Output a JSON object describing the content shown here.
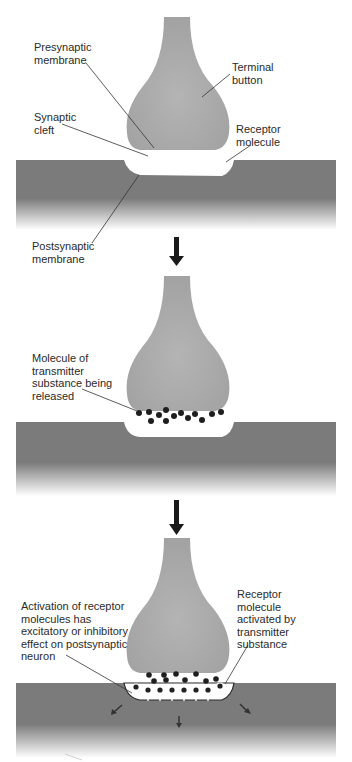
{
  "figure": {
    "colors": {
      "terminal_button": "#a9a9a9",
      "postsynaptic_neuron": "#7b7b7b",
      "transmitter_molecule": "#1e1e1e",
      "arrow": "#1a1a1a",
      "cleft": "#ffffff"
    },
    "panels": [
      {
        "stage": 1,
        "labels": {
          "presynaptic": "Presynaptic\nmembrane",
          "terminal": "Terminal\nbutton",
          "cleft": "Synaptic\ncleft",
          "receptor": "Receptor\nmolecule",
          "postsynaptic": "Postsynaptic\nmembrane"
        }
      },
      {
        "stage": 2,
        "labels": {
          "transmitter": "Molecule of\ntransmitter\nsubstance being\nreleased"
        }
      },
      {
        "stage": 3,
        "labels": {
          "activation": "Activation of receptor\nmolecules has\nexcitatory or inhibitory\neffect on postsynaptic\nneuron",
          "receptor_activated": "Receptor\nmolecule\nactivated by\ntransmitter\nsubstance"
        }
      }
    ],
    "transition_arrows": 2
  }
}
